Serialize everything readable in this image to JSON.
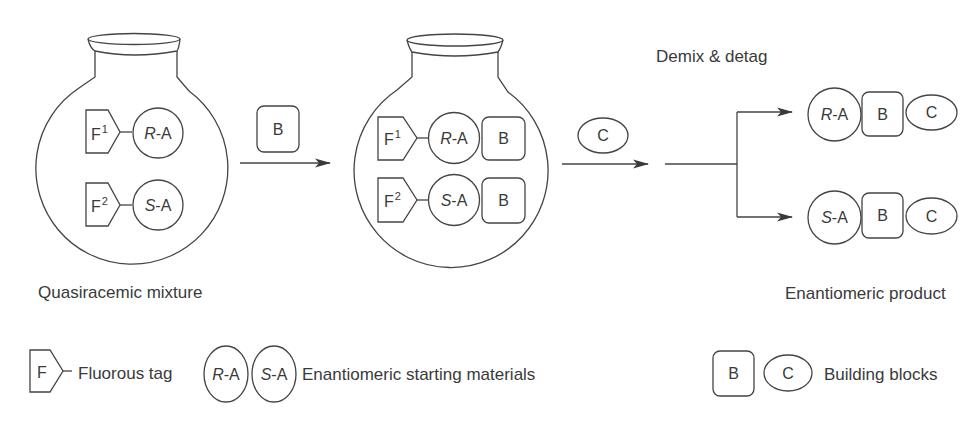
{
  "figure": {
    "flask1": {
      "caption": "Quasiracemic mixture",
      "rows": [
        {
          "tag": "F",
          "tag_index": "1",
          "sm_stereo": "R",
          "sm_suffix": "-A"
        },
        {
          "tag": "F",
          "tag_index": "2",
          "sm_stereo": "S",
          "sm_suffix": "-A"
        }
      ]
    },
    "step1": {
      "reagent": "B"
    },
    "flask2": {
      "rows": [
        {
          "tag": "F",
          "tag_index": "1",
          "sm_stereo": "R",
          "sm_suffix": "-A",
          "block": "B"
        },
        {
          "tag": "F",
          "tag_index": "2",
          "sm_stereo": "S",
          "sm_suffix": "-A",
          "block": "B"
        }
      ]
    },
    "step2": {
      "reagent": "C"
    },
    "step3": {
      "label": "Demix & detag"
    },
    "products": {
      "caption": "Enantiomeric product",
      "rows": [
        {
          "stereo": "R",
          "suffix": "-A",
          "block_b": "B",
          "block_c": "C"
        },
        {
          "stereo": "S",
          "suffix": "-A",
          "block_b": "B",
          "block_c": "C"
        }
      ]
    }
  },
  "legend": {
    "fluorous_tag": {
      "symbol": "F",
      "label": "Fluorous tag"
    },
    "starting_materials": {
      "items": [
        {
          "stereo": "R",
          "suffix": "-A"
        },
        {
          "stereo": "S",
          "suffix": "-A"
        }
      ],
      "label": "Enantiomeric starting materials"
    },
    "building_blocks": {
      "items": [
        "B",
        "C"
      ],
      "label": "Building blocks"
    }
  },
  "colors": {
    "stroke": "#444444",
    "text": "#3a3a3a",
    "background": "#ffffff"
  }
}
